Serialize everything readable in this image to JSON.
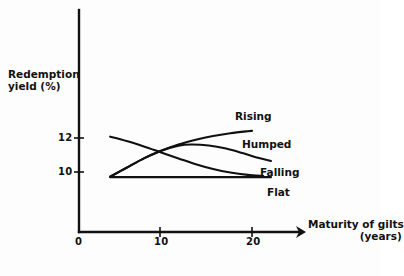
{
  "chart_data": {
    "type": "line",
    "title": "",
    "xlabel": "Maturity of gilts (years)",
    "ylabel": "Redemption yield (%)",
    "xlabel_line1": "Maturity of gilts",
    "xlabel_line2": "(years)",
    "ylabel_line1": "Redemption",
    "ylabel_line2": "yield (%)",
    "xlim": [
      0,
      26
    ],
    "ylim": [
      8.6,
      14.0
    ],
    "xticks": [
      0,
      10,
      20
    ],
    "xtick_labels": [
      "0",
      "10",
      "20"
    ],
    "yticks": [
      10,
      12
    ],
    "ytick_labels": [
      "10",
      "12"
    ],
    "grid": false,
    "legend": "inline-curve-labels",
    "axis_arrow": true,
    "series": [
      {
        "name": "Rising",
        "label": "Rising",
        "x": [
          3.6,
          5.5,
          7.5,
          9.5,
          11.5,
          13.5,
          15.5,
          17.5,
          19.5,
          20.0
        ],
        "y": [
          9.72,
          10.25,
          10.8,
          11.25,
          11.62,
          11.9,
          12.12,
          12.28,
          12.4,
          12.42
        ]
      },
      {
        "name": "Humped",
        "label": "Humped",
        "x": [
          3.6,
          5.5,
          7.5,
          9.5,
          11.5,
          13.0,
          15.0,
          17.0,
          19.0,
          20.8,
          22.2
        ],
        "y": [
          9.72,
          10.25,
          10.8,
          11.25,
          11.55,
          11.62,
          11.56,
          11.38,
          11.1,
          10.82,
          10.65
        ]
      },
      {
        "name": "Falling",
        "label": "Falling",
        "x": [
          3.6,
          5.5,
          7.5,
          9.5,
          11.5,
          13.5,
          15.5,
          17.5,
          19.5,
          21.3
        ],
        "y": [
          12.08,
          11.82,
          11.5,
          11.15,
          10.8,
          10.46,
          10.18,
          9.97,
          9.83,
          9.76
        ]
      },
      {
        "name": "Flat",
        "label": "Flat",
        "x": [
          3.6,
          8.0,
          13.0,
          18.0,
          22.2
        ],
        "y": [
          9.7,
          9.7,
          9.7,
          9.7,
          9.7
        ]
      }
    ],
    "colors": {
      "curve": "#101010",
      "axis": "#111111",
      "background": "#fdfdfd"
    }
  }
}
